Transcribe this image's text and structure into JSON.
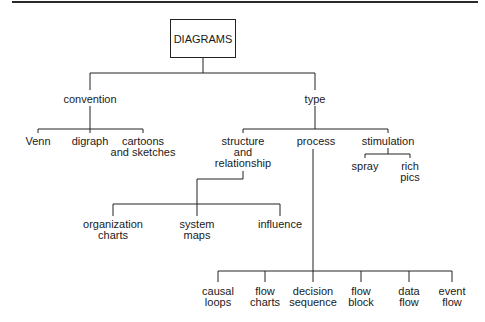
{
  "diagram": {
    "root": {
      "label": "DIAGRAMS"
    },
    "level1": [
      {
        "id": "convention",
        "label": "convention",
        "x": 90,
        "y": 94
      },
      {
        "id": "type",
        "label": "type",
        "x": 315,
        "y": 94
      }
    ],
    "convention_children": [
      {
        "label": "Venn",
        "x": 38,
        "y": 136
      },
      {
        "label": "digraph",
        "x": 90,
        "y": 136
      },
      {
        "label": "cartoons\nand sketches",
        "x": 143,
        "y": 136
      }
    ],
    "type_children": [
      {
        "label": "structure\nand\nrelationship",
        "x": 243,
        "y": 136
      },
      {
        "label": "process",
        "x": 316,
        "y": 136
      },
      {
        "label": "stimulation",
        "x": 388,
        "y": 136
      }
    ],
    "stimulation_children": [
      {
        "label": "spray",
        "x": 365,
        "y": 161
      },
      {
        "label": "rich\npics",
        "x": 410,
        "y": 161
      }
    ],
    "structure_children": [
      {
        "label": "organization\ncharts",
        "x": 113,
        "y": 219
      },
      {
        "label": "system\nmaps",
        "x": 197,
        "y": 219
      },
      {
        "label": "influence",
        "x": 280,
        "y": 219
      }
    ],
    "process_children": [
      {
        "label": "causal\nloops",
        "x": 218,
        "y": 286
      },
      {
        "label": "flow\ncharts",
        "x": 265,
        "y": 286
      },
      {
        "label": "decision\nsequence",
        "x": 313,
        "y": 286
      },
      {
        "label": "flow\nblock",
        "x": 361,
        "y": 286
      },
      {
        "label": "data\nflow",
        "x": 409,
        "y": 286
      },
      {
        "label": "event\nflow",
        "x": 452,
        "y": 286
      }
    ]
  }
}
